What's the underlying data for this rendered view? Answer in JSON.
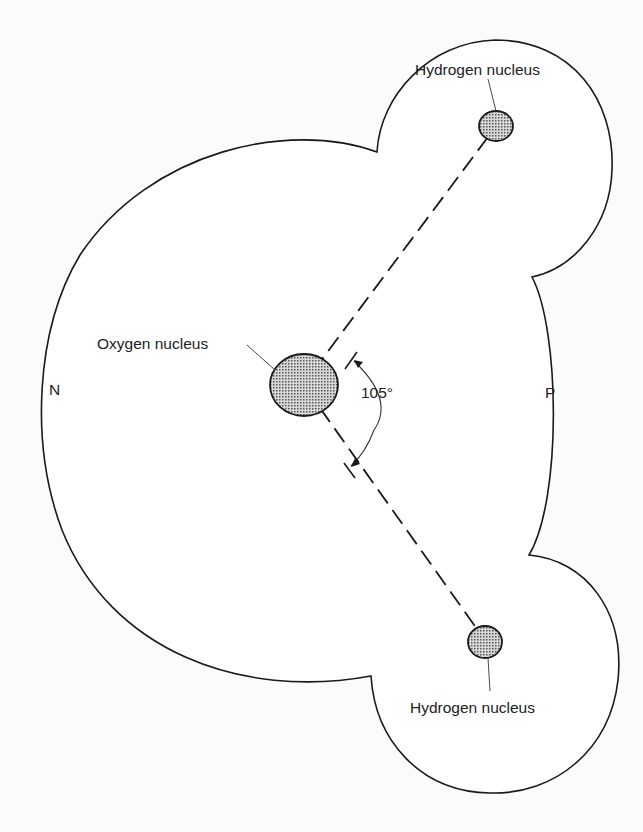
{
  "figure": {
    "labels": {
      "hydrogen_top": "Hydrogen nucleus",
      "hydrogen_bottom": "Hydrogen nucleus",
      "oxygen": "Oxygen nucleus",
      "negative_pole": "N",
      "positive_pole": "P",
      "bond_angle": "105°"
    },
    "colors": {
      "outline": "#1a1a1a",
      "nucleus_fill": "#9a9a9a",
      "background": "#fbfbfb"
    },
    "geometry": {
      "oxygen_center": [
        304,
        385
      ],
      "hydrogen_top_center": [
        496,
        126
      ],
      "hydrogen_bottom_center": [
        485,
        642
      ],
      "bond_angle_degrees": 105
    }
  }
}
